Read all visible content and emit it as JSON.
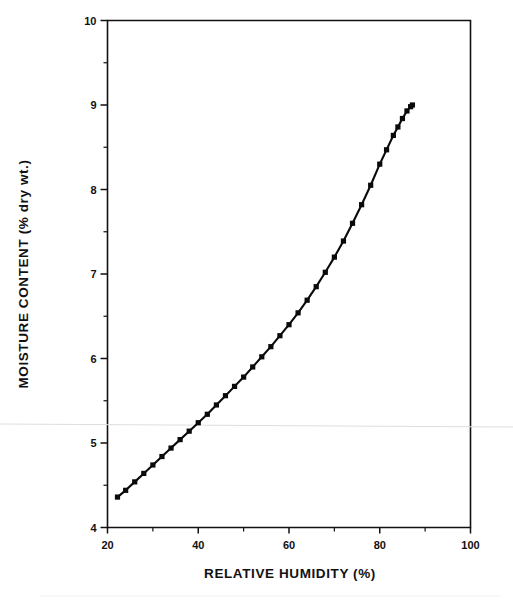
{
  "figure": {
    "background": "#ffffff",
    "ink_color": "#0a0a0a",
    "artifact_color": "#dedede"
  },
  "chart_data": {
    "type": "line",
    "title": "",
    "subtitle": "",
    "xlabel": "RELATIVE HUMIDITY (%)",
    "ylabel": "MOISTURE CONTENT (% dry wt.)",
    "xlim": [
      20,
      100
    ],
    "ylim": [
      4,
      10
    ],
    "grid": false,
    "legend": null,
    "legend_position": "none",
    "x_major_ticks": [
      20,
      40,
      60,
      80,
      100
    ],
    "x_major_tick_labels": [
      "20",
      "40",
      "60",
      "80",
      "100"
    ],
    "x_minor_ticks": [
      30,
      50,
      70,
      90
    ],
    "y_major_ticks": [
      4,
      5,
      6,
      7,
      8,
      9,
      10
    ],
    "y_major_tick_labels": [
      "4",
      "5",
      "6",
      "7",
      "8",
      "9",
      "10"
    ],
    "y_minor_ticks": [
      4.5,
      5.5,
      6.5,
      7.5,
      8.5,
      9.5
    ],
    "marker": "filled-square",
    "series": [
      {
        "name": "Sorption isotherm",
        "x": [
          22.2,
          24.0,
          26.0,
          28.0,
          30.0,
          32.0,
          34.0,
          36.0,
          38.0,
          40.0,
          42.0,
          44.0,
          46.0,
          48.0,
          50.0,
          52.0,
          54.0,
          56.0,
          58.0,
          60.0,
          62.0,
          64.0,
          66.0,
          68.0,
          70.0,
          72.0,
          74.0,
          76.0,
          78.0,
          80.0,
          81.5,
          83.0,
          84.0,
          85.0,
          86.0,
          86.8,
          87.2
        ],
        "y": [
          4.36,
          4.44,
          4.54,
          4.64,
          4.74,
          4.84,
          4.94,
          5.04,
          5.14,
          5.24,
          5.34,
          5.45,
          5.56,
          5.67,
          5.78,
          5.9,
          6.02,
          6.14,
          6.27,
          6.4,
          6.54,
          6.69,
          6.85,
          7.02,
          7.2,
          7.39,
          7.6,
          7.82,
          8.05,
          8.3,
          8.47,
          8.64,
          8.74,
          8.84,
          8.93,
          8.98,
          9.0
        ]
      }
    ]
  },
  "annotations": {
    "scan_line_y_value": 5.28
  }
}
